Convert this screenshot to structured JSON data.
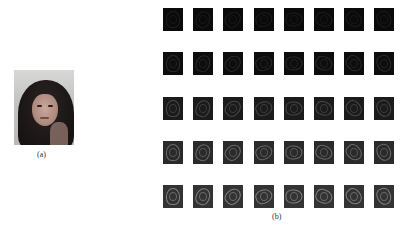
{
  "figure": {
    "panel_a": {
      "caption": "(a)",
      "image_description": "grayscale portrait of a woman with long dark hair"
    },
    "panel_b": {
      "caption": "(b)",
      "image_description": "grid of Gabor filter response images of the face",
      "rows": 5,
      "cols": 8,
      "row_colors": [
        "#0a0a0a",
        "#0d0d0d",
        "#1b1b1b",
        "#2a2a2a",
        "#333333"
      ],
      "row_edge_opacity": [
        0.08,
        0.12,
        0.2,
        0.3,
        0.38
      ]
    }
  }
}
